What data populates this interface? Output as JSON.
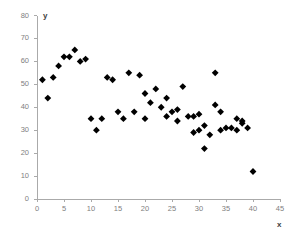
{
  "chart_data": {
    "type": "scatter",
    "title": "",
    "xlabel": "x",
    "ylabel": "y",
    "xlim": [
      0,
      45
    ],
    "ylim": [
      0,
      80
    ],
    "xticks": [
      0,
      5,
      10,
      15,
      20,
      25,
      30,
      35,
      40,
      45
    ],
    "yticks": [
      0,
      10,
      20,
      30,
      40,
      50,
      60,
      70,
      80
    ],
    "grid": false,
    "legend": null,
    "marker": {
      "shape": "diamond",
      "color": "#000000",
      "size": 3.4
    },
    "axis_color": "#aaaaaa",
    "tick_label_color": "#808080",
    "background": "#ffffff",
    "series": [
      {
        "name": "observations",
        "points": [
          [
            1,
            52
          ],
          [
            2,
            44
          ],
          [
            4,
            58
          ],
          [
            5,
            62
          ],
          [
            6,
            62
          ],
          [
            7,
            65
          ],
          [
            8,
            60
          ],
          [
            9,
            61
          ],
          [
            11,
            30
          ],
          [
            12,
            35
          ],
          [
            13,
            53
          ],
          [
            14,
            52
          ],
          [
            15,
            38
          ],
          [
            16,
            35
          ],
          [
            17,
            55
          ],
          [
            18,
            38
          ],
          [
            19,
            54
          ],
          [
            20,
            35
          ],
          [
            21,
            42
          ],
          [
            22,
            48
          ],
          [
            23,
            40
          ],
          [
            24,
            44
          ],
          [
            25,
            38
          ],
          [
            26,
            39
          ],
          [
            27,
            49
          ],
          [
            28,
            36
          ],
          [
            29,
            36
          ],
          [
            29,
            29
          ],
          [
            30,
            30
          ],
          [
            31,
            32
          ],
          [
            31,
            22
          ],
          [
            32,
            28
          ],
          [
            33,
            41
          ],
          [
            33,
            55
          ],
          [
            34,
            38
          ],
          [
            35,
            31
          ],
          [
            36,
            31
          ],
          [
            37,
            35
          ],
          [
            38,
            33
          ],
          [
            38,
            34
          ],
          [
            39,
            31
          ],
          [
            40,
            12
          ],
          [
            10,
            35
          ],
          [
            3,
            53
          ],
          [
            20,
            46
          ],
          [
            24,
            36
          ],
          [
            26,
            34
          ],
          [
            30,
            37
          ],
          [
            34,
            30
          ],
          [
            37,
            30
          ]
        ]
      }
    ]
  },
  "axis_titles": {
    "x": "x",
    "y": "y"
  }
}
